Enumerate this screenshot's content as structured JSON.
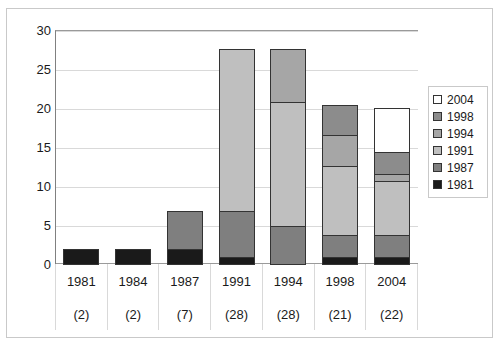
{
  "chart_data": {
    "type": "bar",
    "title": "",
    "xlabel": "",
    "ylabel": "",
    "ylim": [
      0,
      30
    ],
    "yticks": [
      0,
      5,
      10,
      15,
      20,
      25,
      30
    ],
    "grid": true,
    "stacked": true,
    "legend_position": "right",
    "categories": [
      "1981",
      "1984",
      "1987",
      "1991",
      "1994",
      "1998",
      "2004"
    ],
    "category_counts": [
      "(2)",
      "(2)",
      "(7)",
      "(28)",
      "(28)",
      "(21)",
      "(22)"
    ],
    "series": [
      {
        "name": "1981",
        "color": "#1a1a1a",
        "values": [
          2,
          2,
          2,
          1,
          0,
          1,
          1
        ]
      },
      {
        "name": "1987",
        "color": "#7f7f7f",
        "values": [
          0,
          0,
          5,
          6,
          5,
          3,
          3
        ]
      },
      {
        "name": "1991",
        "color": "#bfbfbf",
        "values": [
          0,
          0,
          0,
          21,
          16,
          9,
          7
        ]
      },
      {
        "name": "1994",
        "color": "#a6a6a6",
        "values": [
          0,
          0,
          0,
          0,
          7,
          4,
          1
        ]
      },
      {
        "name": "1998",
        "color": "#8c8c8c",
        "values": [
          0,
          0,
          0,
          0,
          0,
          4,
          3
        ]
      },
      {
        "name": "2004",
        "color": "#ffffff",
        "values": [
          0,
          0,
          0,
          0,
          0,
          0,
          5.8
        ]
      }
    ],
    "totals": [
      2,
      2,
      7,
      28,
      28,
      21,
      21.8
    ],
    "legend_entries": [
      {
        "label": "2004",
        "color": "#ffffff"
      },
      {
        "label": "1998",
        "color": "#8c8c8c"
      },
      {
        "label": "1994",
        "color": "#a6a6a6"
      },
      {
        "label": "1991",
        "color": "#bfbfbf"
      },
      {
        "label": "1987",
        "color": "#7f7f7f"
      },
      {
        "label": "1981",
        "color": "#1a1a1a"
      }
    ]
  }
}
